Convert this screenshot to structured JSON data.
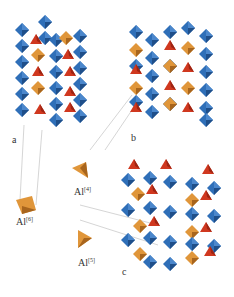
{
  "figure": {
    "panels": [
      {
        "id": "a",
        "label": "a",
        "description": "framework with octahedral Al"
      },
      {
        "id": "b",
        "label": "b",
        "description": "framework with tetrahedral Al"
      },
      {
        "id": "c",
        "label": "c",
        "description": "framework with pentacoordinated Al"
      }
    ],
    "polyhedra": [
      {
        "label_main": "Al",
        "label_sup": "[6]",
        "shape": "octahedron"
      },
      {
        "label_main": "Al",
        "label_sup": "[4]",
        "shape": "tetrahedron"
      },
      {
        "label_main": "Al",
        "label_sup": "[5]",
        "shape": "trigonal-bipyramid"
      }
    ],
    "colors": {
      "blue": "#2f6fb8",
      "blue_dark": "#1f4f8a",
      "red": "#d0381f",
      "red_dark": "#9e2412",
      "orange": "#e0963a",
      "orange_dark": "#a8651d",
      "line": "#b8b8b8"
    }
  }
}
